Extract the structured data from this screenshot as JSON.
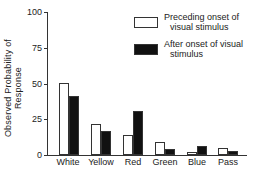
{
  "chart_data": {
    "type": "bar",
    "title": "",
    "xlabel": "",
    "ylabel": "Observed Probability of Response",
    "ylim": [
      0,
      100
    ],
    "yticks": [
      "0",
      "25",
      "50",
      "75",
      "100"
    ],
    "categories": [
      "White",
      "Yellow",
      "Red",
      "Green",
      "Blue",
      "Pass"
    ],
    "series": [
      {
        "name": "Preceding onset of visual stimulus",
        "style": "open",
        "values": [
          50,
          22,
          14,
          9,
          2,
          5
        ]
      },
      {
        "name": "After onset of visual stimulus",
        "style": "filled",
        "values": [
          41,
          17,
          31,
          4,
          6,
          3
        ]
      }
    ],
    "legend": {
      "position": "upper right",
      "entries": [
        {
          "line1": "Preceding onset of",
          "line2": "visual stimulus"
        },
        {
          "line1": "After onset of visual",
          "line2": "stimulus"
        }
      ]
    },
    "grid": false
  }
}
